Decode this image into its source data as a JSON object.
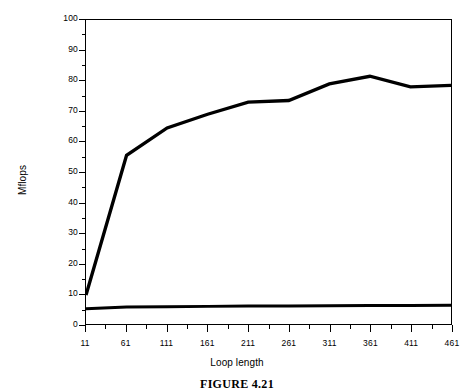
{
  "caption": "FIGURE 4.21",
  "chart_data": {
    "type": "line",
    "title": "",
    "subtitle": "",
    "xlabel": "Loop length",
    "ylabel": "Mflops",
    "xlim": [
      11,
      461
    ],
    "ylim": [
      0,
      100
    ],
    "grid": false,
    "legend": "none",
    "x_tick_labels": [
      "11",
      "61",
      "111",
      "161",
      "211",
      "261",
      "311",
      "361",
      "411",
      "461"
    ],
    "x_tick_values": [
      11,
      61,
      111,
      161,
      211,
      261,
      311,
      361,
      411,
      461
    ],
    "x_minor_tick_values": [
      36,
      86,
      136,
      186,
      236,
      286,
      336,
      386,
      436
    ],
    "y_tick_labels": [
      "0",
      "10",
      "20",
      "30",
      "40",
      "50",
      "60",
      "70",
      "80",
      "90",
      "100"
    ],
    "y_tick_values": [
      0,
      10,
      20,
      30,
      40,
      50,
      60,
      70,
      80,
      90,
      100
    ],
    "y_minor_tick_values": [
      5,
      15,
      25,
      35,
      45,
      55,
      65,
      75,
      85,
      95
    ],
    "x": [
      11,
      61,
      111,
      161,
      211,
      261,
      311,
      361,
      411,
      461
    ],
    "series": [
      {
        "name": "upper-curve",
        "color": "#000000",
        "line_width": 3.4,
        "values": [
          9.5,
          55.5,
          64.5,
          69.0,
          73.0,
          73.5,
          79.0,
          81.5,
          78.0,
          78.5
        ]
      },
      {
        "name": "lower-curve",
        "color": "#000000",
        "line_width": 3.0,
        "values": [
          5.0,
          5.6,
          5.7,
          5.8,
          5.9,
          5.9,
          6.0,
          6.1,
          6.1,
          6.2
        ]
      }
    ]
  }
}
